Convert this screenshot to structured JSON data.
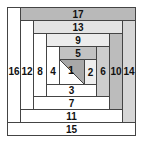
{
  "diagram": {
    "type": "log-cabin-quilt-block",
    "colors": {
      "white": "#ffffff",
      "gray_dark": "#b4b4b4",
      "gray_mid": "#c8c8c8",
      "gray_light": "#dcdcdc",
      "gray_lighter": "#e8e8e8",
      "border": "#444444"
    },
    "strips": [
      {
        "label": "17",
        "x": 20,
        "y": 7,
        "w": 115,
        "h": 13,
        "fill": "#b9b9b9"
      },
      {
        "label": "16",
        "x": 7,
        "y": 7,
        "w": 13,
        "h": 128,
        "fill": "#ffffff"
      },
      {
        "label": "15",
        "x": 7,
        "y": 122,
        "w": 128,
        "h": 13,
        "fill": "#ffffff"
      },
      {
        "label": "14",
        "x": 122,
        "y": 20,
        "w": 13,
        "h": 102,
        "fill": "#d6d6d6"
      },
      {
        "label": "13",
        "x": 33,
        "y": 20,
        "w": 89,
        "h": 13,
        "fill": "#e4e4e4"
      },
      {
        "label": "12",
        "x": 20,
        "y": 20,
        "w": 13,
        "h": 102,
        "fill": "#ffffff"
      },
      {
        "label": "11",
        "x": 20,
        "y": 109,
        "w": 102,
        "h": 13,
        "fill": "#ffffff"
      },
      {
        "label": "10",
        "x": 109,
        "y": 33,
        "w": 13,
        "h": 76,
        "fill": "#bcbcbc"
      },
      {
        "label": "9",
        "x": 46,
        "y": 33,
        "w": 63,
        "h": 13,
        "fill": "#ececec"
      },
      {
        "label": "8",
        "x": 33,
        "y": 33,
        "w": 13,
        "h": 76,
        "fill": "#ffffff"
      },
      {
        "label": "7",
        "x": 33,
        "y": 96,
        "w": 76,
        "h": 13,
        "fill": "#ffffff"
      },
      {
        "label": "6",
        "x": 96,
        "y": 46,
        "w": 13,
        "h": 50,
        "fill": "#cdcdcd"
      },
      {
        "label": "5",
        "x": 59,
        "y": 46,
        "w": 37,
        "h": 13,
        "fill": "#c2c2c2"
      },
      {
        "label": "4",
        "x": 46,
        "y": 46,
        "w": 13,
        "h": 50,
        "fill": "#ffffff"
      },
      {
        "label": "3",
        "x": 46,
        "y": 84,
        "w": 50,
        "h": 12,
        "fill": "#ffffff"
      },
      {
        "label": "2",
        "x": 84,
        "y": 59,
        "w": 12,
        "h": 25,
        "fill": "#eeeeee"
      }
    ],
    "center": {
      "label": "1",
      "x": 59,
      "y": 59,
      "w": 25,
      "h": 25,
      "triangle_fill": "#a8a8a8",
      "base_fill": "#ffffff",
      "split": "diagonal top-left to bottom-right, shaded upper-right half"
    }
  }
}
